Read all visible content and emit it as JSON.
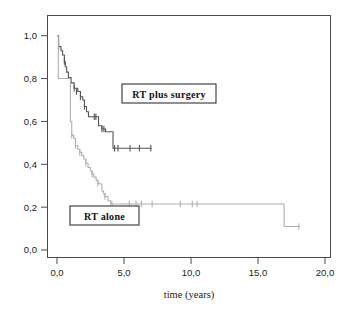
{
  "figure": {
    "title": "",
    "background_color": "#ffffff"
  },
  "axes": {
    "x": {
      "label": "time (years)",
      "ticks": [
        "0,0",
        "5,0",
        "10,0",
        "15,0",
        "20,0"
      ],
      "tick_values": [
        0,
        5,
        10,
        15,
        20
      ],
      "range": [
        0,
        20
      ]
    },
    "y": {
      "label": "",
      "ticks": [
        "0,0",
        "0,2",
        "0,4",
        "0,6",
        "0,8",
        "1,0"
      ],
      "tick_values": [
        0.0,
        0.2,
        0.4,
        0.6,
        0.8,
        1.0
      ],
      "range": [
        0,
        1.05
      ]
    }
  },
  "annotations": [
    {
      "name": "rt-plus-surgery-label",
      "text": "RT plus surgery"
    },
    {
      "name": "rt-alone-label",
      "text": "RT alone"
    }
  ],
  "colors": {
    "rt_plus_surgery": "#555555",
    "rt_alone": "#b0b0b0",
    "axis": "#4a4a4a",
    "text": "#1a1a1a"
  },
  "chart_data": {
    "type": "line",
    "subtype": "kaplan-meier-step",
    "title": "",
    "xlabel": "time (years)",
    "ylabel": "",
    "xlim": [
      0,
      20
    ],
    "ylim": [
      0,
      1.05
    ],
    "grid": false,
    "legend_position": "inline-boxed-annotations",
    "series": [
      {
        "name": "RT plus surgery",
        "color": "#555555",
        "step": "post",
        "points": [
          [
            0.0,
            1.0
          ],
          [
            0.12,
            0.95
          ],
          [
            0.3,
            0.93
          ],
          [
            0.42,
            0.91
          ],
          [
            0.55,
            0.88
          ],
          [
            0.62,
            0.855
          ],
          [
            0.72,
            0.83
          ],
          [
            0.85,
            0.805
          ],
          [
            1.05,
            0.78
          ],
          [
            1.28,
            0.755
          ],
          [
            1.55,
            0.74
          ],
          [
            1.75,
            0.715
          ],
          [
            1.92,
            0.7
          ],
          [
            2.05,
            0.67
          ],
          [
            2.2,
            0.645
          ],
          [
            2.35,
            0.622
          ],
          [
            3.0,
            0.622
          ],
          [
            3.1,
            0.58
          ],
          [
            3.35,
            0.565
          ],
          [
            3.62,
            0.552
          ],
          [
            4.05,
            0.552
          ],
          [
            4.18,
            0.475
          ],
          [
            7.05,
            0.475
          ]
        ],
        "censored": [
          [
            0.12,
            0.95
          ],
          [
            0.55,
            0.88
          ],
          [
            1.28,
            0.755
          ],
          [
            1.45,
            0.74
          ],
          [
            1.75,
            0.715
          ],
          [
            2.05,
            0.67
          ],
          [
            2.78,
            0.622
          ],
          [
            2.9,
            0.622
          ],
          [
            3.35,
            0.565
          ],
          [
            3.5,
            0.565
          ],
          [
            4.3,
            0.475
          ],
          [
            4.55,
            0.475
          ],
          [
            5.45,
            0.475
          ],
          [
            6.15,
            0.475
          ],
          [
            7.0,
            0.475
          ]
        ]
      },
      {
        "name": "RT alone",
        "color": "#b0b0b0",
        "step": "post",
        "points": [
          [
            0.0,
            1.0
          ],
          [
            0.1,
            0.8
          ],
          [
            0.95,
            0.8
          ],
          [
            1.0,
            0.6
          ],
          [
            1.1,
            0.535
          ],
          [
            1.25,
            0.52
          ],
          [
            1.38,
            0.488
          ],
          [
            1.55,
            0.47
          ],
          [
            1.7,
            0.455
          ],
          [
            1.85,
            0.44
          ],
          [
            2.0,
            0.425
          ],
          [
            2.15,
            0.405
          ],
          [
            2.32,
            0.385
          ],
          [
            2.48,
            0.37
          ],
          [
            2.62,
            0.355
          ],
          [
            2.75,
            0.34
          ],
          [
            2.92,
            0.325
          ],
          [
            3.05,
            0.31
          ],
          [
            3.2,
            0.308
          ],
          [
            3.35,
            0.275
          ],
          [
            3.48,
            0.262
          ],
          [
            3.58,
            0.25
          ],
          [
            3.8,
            0.23
          ],
          [
            4.0,
            0.215
          ],
          [
            16.9,
            0.215
          ],
          [
            16.95,
            0.11
          ],
          [
            18.1,
            0.11
          ]
        ],
        "censored": [
          [
            1.1,
            0.535
          ],
          [
            1.38,
            0.488
          ],
          [
            1.7,
            0.455
          ],
          [
            2.15,
            0.405
          ],
          [
            2.62,
            0.355
          ],
          [
            3.05,
            0.31
          ],
          [
            3.58,
            0.25
          ],
          [
            4.1,
            0.215
          ],
          [
            5.4,
            0.215
          ],
          [
            5.9,
            0.215
          ],
          [
            6.3,
            0.215
          ],
          [
            7.1,
            0.215
          ],
          [
            9.2,
            0.215
          ],
          [
            10.1,
            0.215
          ],
          [
            10.45,
            0.215
          ],
          [
            18.05,
            0.11
          ]
        ]
      }
    ]
  }
}
